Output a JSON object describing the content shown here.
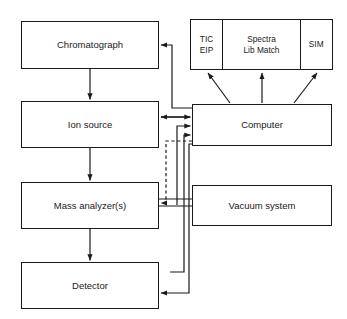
{
  "diagram": {
    "stroke_color": "#1a1a1a",
    "background_color": "#ffffff",
    "blocks": {
      "chromatograph": {
        "label": "Chromatograph"
      },
      "ion_source": {
        "label": "Ion source"
      },
      "mass_analyzer": {
        "label": "Mass analyzer(s)"
      },
      "detector": {
        "label": "Detector"
      },
      "computer": {
        "label": "Computer"
      },
      "vacuum_system": {
        "label": "Vacuum system"
      }
    },
    "outputs": {
      "cells": [
        {
          "label": "TIC\nEIP"
        },
        {
          "label": "Spectra\nLib Match"
        },
        {
          "label": "SIM"
        }
      ]
    },
    "connections": [
      {
        "from": "chromatograph",
        "to": "ion_source",
        "style": "solid",
        "direction": "one-way"
      },
      {
        "from": "ion_source",
        "to": "mass_analyzer",
        "style": "solid",
        "direction": "one-way"
      },
      {
        "from": "mass_analyzer",
        "to": "detector",
        "style": "solid",
        "direction": "one-way"
      },
      {
        "from": "computer",
        "to": "chromatograph",
        "style": "solid",
        "direction": "one-way"
      },
      {
        "from": "ion_source",
        "to": "computer",
        "style": "solid",
        "direction": "two-way"
      },
      {
        "from": "computer",
        "to": "mass_analyzer",
        "style": "dashed",
        "direction": "one-way"
      },
      {
        "from": "mass_analyzer",
        "to": "computer",
        "style": "solid",
        "direction": "one-way"
      },
      {
        "from": "detector",
        "to": "computer",
        "style": "solid",
        "direction": "one-way"
      },
      {
        "from": "computer",
        "to": "detector",
        "style": "solid",
        "direction": "one-way"
      },
      {
        "from": "vacuum_system",
        "to": "mass_analyzer",
        "style": "solid",
        "direction": "one-way"
      },
      {
        "from": "computer",
        "to": "output_tic",
        "style": "solid",
        "direction": "one-way"
      },
      {
        "from": "computer",
        "to": "output_spectra",
        "style": "solid",
        "direction": "one-way"
      },
      {
        "from": "computer",
        "to": "output_sim",
        "style": "solid",
        "direction": "one-way"
      }
    ]
  }
}
